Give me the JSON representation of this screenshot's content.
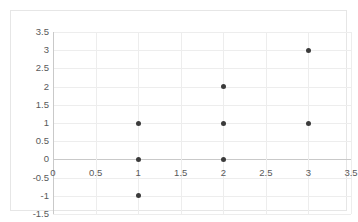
{
  "chart_data": {
    "type": "scatter",
    "title": "",
    "xlabel": "",
    "ylabel": "",
    "xlim": [
      0,
      3.5
    ],
    "ylim": [
      -1.5,
      3.5
    ],
    "xticks": [
      "0",
      "0.5",
      "1",
      "1.5",
      "2",
      "2.5",
      "3",
      "3.5"
    ],
    "xtick_values": [
      0,
      0.5,
      1,
      1.5,
      2,
      2.5,
      3,
      3.5
    ],
    "yticks": [
      "3.5",
      "3",
      "2.5",
      "2",
      "1.5",
      "1",
      "0.5",
      "0",
      "-0.5",
      "-1",
      "-1.5"
    ],
    "ytick_values": [
      3.5,
      3,
      2.5,
      2,
      1.5,
      1,
      0.5,
      0,
      -0.5,
      -1,
      -1.5
    ],
    "grid": true,
    "legend": false,
    "legend_position": "none",
    "marker_color": "#3b3b3b",
    "gridline_color": "#ededed",
    "axis_color": "#c9c9c9",
    "border_color": "#e6e6e6",
    "background_color": "#ffffff",
    "points": [
      {
        "x": 1,
        "y": 1
      },
      {
        "x": 1,
        "y": 0
      },
      {
        "x": 1,
        "y": -1
      },
      {
        "x": 2,
        "y": 2
      },
      {
        "x": 2,
        "y": 1
      },
      {
        "x": 2,
        "y": 0
      },
      {
        "x": 3,
        "y": 3
      },
      {
        "x": 3,
        "y": 1
      }
    ]
  }
}
